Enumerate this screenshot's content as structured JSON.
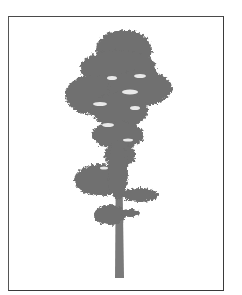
{
  "image": {
    "subject": "Tall conifer tree silhouette in grayscale within a rectangular frame",
    "colors": {
      "background": "#ffffff",
      "frame": "#3a3a3a",
      "foliage": "#6f6f6f",
      "trunk": "#7a7a7a"
    }
  },
  "caption": "Tree"
}
